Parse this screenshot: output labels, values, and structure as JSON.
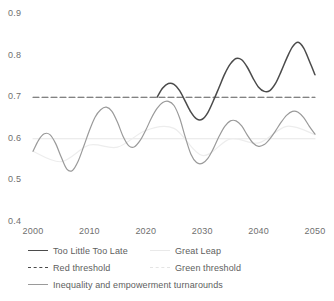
{
  "chart_data": {
    "type": "line",
    "title": "",
    "xlabel": "",
    "ylabel": "",
    "xlim": [
      2000,
      2050
    ],
    "ylim": [
      0.4,
      0.9
    ],
    "grid": false,
    "legend_position": "bottom",
    "y_ticks": [
      "0.9",
      "0.8",
      "0.7",
      "0.6",
      "0.5",
      "0.4"
    ],
    "y_tick_values": [
      0.9,
      0.8,
      0.7,
      0.6,
      0.5,
      0.4
    ],
    "x_ticks": [
      "2000",
      "2010",
      "2020",
      "2030",
      "2040",
      "2050"
    ],
    "x_tick_values": [
      2000,
      2010,
      2020,
      2030,
      2040,
      2050
    ],
    "thresholds": [
      {
        "name": "Red threshold",
        "value": 0.7,
        "style": "dashed",
        "color": "#5a5a5a"
      },
      {
        "name": "Green threshold",
        "value": 0.6,
        "style": "solid",
        "color": "#e6e6e6"
      }
    ],
    "series": [
      {
        "name": "Too Little Too Late",
        "color": "#4b4b4b",
        "style": "solid",
        "x": [
          2022,
          2023,
          2024,
          2025,
          2026,
          2027,
          2028,
          2029,
          2030,
          2031,
          2032,
          2033,
          2034,
          2035,
          2036,
          2037,
          2038,
          2039,
          2040,
          2041,
          2042,
          2043,
          2044,
          2045,
          2046,
          2047,
          2048,
          2049,
          2050
        ],
        "values": [
          0.7,
          0.722,
          0.733,
          0.731,
          0.716,
          0.69,
          0.664,
          0.648,
          0.647,
          0.663,
          0.692,
          0.724,
          0.756,
          0.78,
          0.793,
          0.79,
          0.772,
          0.746,
          0.724,
          0.714,
          0.716,
          0.733,
          0.762,
          0.794,
          0.821,
          0.832,
          0.818,
          0.787,
          0.754
        ]
      },
      {
        "name": "Great Leap",
        "color": "#ededed",
        "style": "solid",
        "x": [
          2000,
          2005,
          2010,
          2015,
          2020,
          2025,
          2030,
          2035,
          2040,
          2045,
          2050
        ],
        "values": [
          0.57,
          0.545,
          0.585,
          0.58,
          0.62,
          0.625,
          0.56,
          0.6,
          0.59,
          0.63,
          0.61
        ]
      },
      {
        "name": "Inequality and empowerment turnarounds",
        "color": "#9a9a9a",
        "style": "solid",
        "x": [
          2000,
          2001,
          2002,
          2003,
          2004,
          2005,
          2006,
          2007,
          2008,
          2009,
          2010,
          2011,
          2012,
          2013,
          2014,
          2015,
          2016,
          2017,
          2018,
          2019,
          2020,
          2021,
          2022,
          2023,
          2024,
          2025,
          2026,
          2027,
          2028,
          2029,
          2030,
          2031,
          2032,
          2033,
          2034,
          2035,
          2036,
          2037,
          2038,
          2039,
          2040,
          2041,
          2042,
          2043,
          2044,
          2045,
          2046,
          2047,
          2048,
          2049,
          2050
        ],
        "values": [
          0.57,
          0.597,
          0.612,
          0.61,
          0.589,
          0.556,
          0.527,
          0.524,
          0.546,
          0.582,
          0.62,
          0.652,
          0.67,
          0.676,
          0.666,
          0.639,
          0.605,
          0.583,
          0.581,
          0.596,
          0.621,
          0.65,
          0.673,
          0.687,
          0.69,
          0.68,
          0.65,
          0.604,
          0.563,
          0.543,
          0.541,
          0.553,
          0.577,
          0.606,
          0.63,
          0.643,
          0.643,
          0.631,
          0.609,
          0.59,
          0.582,
          0.586,
          0.6,
          0.619,
          0.64,
          0.657,
          0.666,
          0.664,
          0.651,
          0.63,
          0.611
        ]
      }
    ],
    "legend": [
      {
        "label": "Too Little Too Late",
        "swatch": "solid-dark"
      },
      {
        "label": "Great Leap",
        "swatch": "solid-faint"
      },
      {
        "label": "Red threshold",
        "swatch": "dash-dark"
      },
      {
        "label": "Green threshold",
        "swatch": "dash-faint"
      },
      {
        "label": "Inequality and empowerment turnarounds",
        "swatch": "solid-mid"
      }
    ]
  }
}
